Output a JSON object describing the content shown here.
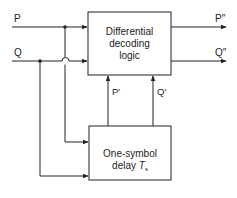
{
  "diagram": {
    "inputs": {
      "p": "P",
      "q": "Q"
    },
    "outputs": {
      "p_out": "P″",
      "q_out": "Q″"
    },
    "feedback": {
      "p_prime": "P′",
      "q_prime": "Q′"
    },
    "blocks": {
      "decoder": {
        "line1": "Differential",
        "line2": "decoding",
        "line3": "logic"
      },
      "delay": {
        "line1": "One-symbol",
        "line2_text": "delay ",
        "line2_symbol": "T",
        "line2_subscript": "s"
      }
    },
    "colors": {
      "stroke": "#222222",
      "background": "#ffffff"
    }
  }
}
